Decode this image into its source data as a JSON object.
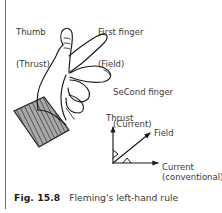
{
  "figure": {
    "caption_number": "Fig. 15.8",
    "caption_text": "Fleming's left-hand rule",
    "labels": {
      "thumb_line1": "Thumb",
      "thumb_line2": "(Thrust)",
      "first_finger_line1": "First finger",
      "first_finger_line2": "(Field)",
      "second_finger_line1": "SeCond finger",
      "second_finger_line2": "(Current)"
    },
    "axes": {
      "thrust": "Thrust",
      "field": "Field",
      "current": "Current",
      "current_note": "(conventional)"
    },
    "colors": {
      "ink": "#1a1a1a",
      "text": "#3a3a3a",
      "rule": "#6f6f6f",
      "cuff_fill": "#a8a8a8",
      "cuff_hatch": "#4a4a4a",
      "background": "#ffffff"
    },
    "icons": {
      "hand": "left-hand-illustration",
      "cuff": "sleeve-cuff-hatched",
      "axes": "three-axis-vector-diagram"
    }
  }
}
